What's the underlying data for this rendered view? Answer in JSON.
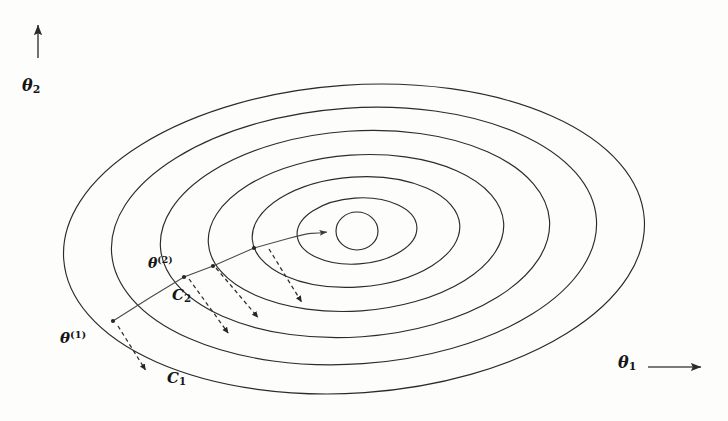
{
  "figure": {
    "kind": "contour-descent-diagram",
    "background_color": "#fdfdfc",
    "ink_color": "#2b2b2b",
    "width": 728,
    "height": 421
  },
  "axes": {
    "y_axis": {
      "label": "θ",
      "subscript": "2",
      "arrow_direction": "up",
      "arrow_from": [
        38,
        58
      ],
      "arrow_to": [
        38,
        20
      ]
    },
    "x_axis": {
      "label": "θ",
      "subscript": "1",
      "arrow_direction": "right",
      "arrow_from": [
        648,
        367
      ],
      "arrow_to": [
        706,
        367
      ]
    }
  },
  "labels": {
    "theta_initial": {
      "base": "θ",
      "superscript": "(1)"
    },
    "theta_second": {
      "base": "θ",
      "superscript": "(2)"
    },
    "contour_c1": {
      "base": "C",
      "subscript": "1"
    },
    "contour_c2": {
      "base": "C",
      "subscript": "2"
    }
  },
  "chart_data": {
    "type": "contour",
    "title": "",
    "xlabel": "θ₁",
    "ylabel": "θ₂",
    "grid": false,
    "legend": "none",
    "center": [
      357,
      231
    ],
    "contours": [
      {
        "name": "level-7-outermost",
        "cx": 354,
        "cy": 239,
        "rx": 291,
        "ry": 154,
        "rotation": -4
      },
      {
        "name": "level-6",
        "cx": 354,
        "cy": 236,
        "rx": 243,
        "ry": 128,
        "rotation": -4
      },
      {
        "name": "level-5",
        "cx": 355,
        "cy": 234,
        "rx": 195,
        "ry": 103,
        "rotation": -4
      },
      {
        "name": "level-4",
        "cx": 356,
        "cy": 233,
        "rx": 148,
        "ry": 78,
        "rotation": -4
      },
      {
        "name": "level-3",
        "cx": 356,
        "cy": 232,
        "rx": 104,
        "ry": 55,
        "rotation": -4
      },
      {
        "name": "level-2",
        "cx": 357,
        "cy": 231,
        "rx": 60,
        "ry": 33,
        "rotation": -4
      },
      {
        "name": "level-1-innermost",
        "cx": 357,
        "cy": 231,
        "rx": 21,
        "ry": 19,
        "rotation": 0
      }
    ],
    "descent_path": {
      "style": "solid",
      "points": [
        [
          113,
          321
        ],
        [
          151,
          297
        ],
        [
          184,
          277
        ],
        [
          213,
          266
        ],
        [
          254,
          248
        ],
        [
          290,
          238
        ],
        [
          325,
          232
        ]
      ],
      "arrowhead_at": [
        332,
        231
      ],
      "annotation": "iterate trajectory from θ(1) toward the optimum"
    },
    "gradient_arrows": [
      {
        "name": "gradient-arrow-1",
        "from": [
          118,
          326
        ],
        "to": [
          148,
          374
        ],
        "style": "dashed"
      },
      {
        "name": "gradient-arrow-2",
        "from": [
          189,
          279
        ],
        "to": [
          231,
          337
        ],
        "style": "dashed"
      },
      {
        "name": "gradient-arrow-3",
        "from": [
          216,
          268
        ],
        "to": [
          261,
          321
        ],
        "style": "dashed"
      },
      {
        "name": "gradient-arrow-4",
        "from": [
          269,
          249
        ],
        "to": [
          304,
          306
        ],
        "style": "dashed"
      }
    ],
    "marked_points": [
      {
        "name": "theta-1",
        "label": "θ(1)",
        "at": [
          113,
          321
        ]
      },
      {
        "name": "theta-2",
        "label": "θ(2)",
        "at": [
          184,
          277
        ]
      },
      {
        "name": "iterate-3",
        "label": "",
        "at": [
          213,
          266
        ]
      },
      {
        "name": "iterate-4",
        "label": "",
        "at": [
          254,
          248
        ]
      }
    ]
  }
}
